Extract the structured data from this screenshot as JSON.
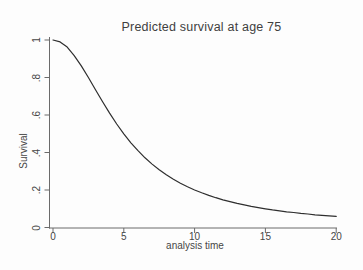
{
  "colors": {
    "background": "#fdfdfd",
    "axis": "#6b6b6b",
    "text": "#464646",
    "curve": "#2e2e2e"
  },
  "chart_data": {
    "type": "line",
    "title": "Predicted survival at age 75",
    "xlabel": "analysis time",
    "ylabel": "Survival",
    "xlim": [
      0,
      20
    ],
    "ylim": [
      0,
      1
    ],
    "grid": false,
    "legend": "none",
    "xticks": {
      "values": [
        0,
        5,
        10,
        15,
        20
      ],
      "labels": [
        "0",
        "5",
        "10",
        "15",
        "20"
      ]
    },
    "yticks": {
      "values": [
        0,
        0.2,
        0.4,
        0.6,
        0.8,
        1
      ],
      "labels": [
        "0",
        ".2",
        ".4",
        ".6",
        ".8",
        "1"
      ]
    },
    "series": [
      {
        "name": "Predicted survival",
        "x": [
          0,
          0.5,
          1,
          1.5,
          2,
          2.5,
          3,
          3.5,
          4,
          4.5,
          5,
          5.5,
          6,
          6.5,
          7,
          7.5,
          8,
          8.5,
          9,
          9.5,
          10,
          10.5,
          11,
          11.5,
          12,
          12.5,
          13,
          13.5,
          14,
          14.5,
          15,
          15.5,
          16,
          16.5,
          17,
          17.5,
          18,
          18.5,
          19,
          19.5,
          20
        ],
        "y": [
          1.0,
          0.99,
          0.962,
          0.917,
          0.862,
          0.8,
          0.735,
          0.671,
          0.61,
          0.552,
          0.5,
          0.452,
          0.41,
          0.372,
          0.338,
          0.308,
          0.281,
          0.257,
          0.236,
          0.217,
          0.2,
          0.185,
          0.171,
          0.159,
          0.148,
          0.138,
          0.129,
          0.121,
          0.113,
          0.106,
          0.1,
          0.094,
          0.089,
          0.084,
          0.08,
          0.075,
          0.072,
          0.068,
          0.065,
          0.062,
          0.059
        ],
        "color": "#2e2e2e"
      }
    ]
  }
}
